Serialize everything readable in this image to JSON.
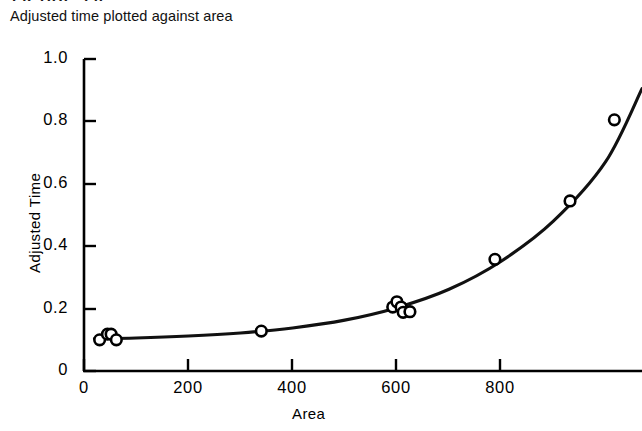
{
  "figure": {
    "top_remnant": "FIGURE 2.9",
    "caption": "Adjusted time plotted against area"
  },
  "chart_data": {
    "type": "scatter",
    "title": "Adjusted time plotted against area",
    "xlabel": "Area",
    "ylabel": "Adjusted Time",
    "xlim": [
      0,
      1070
    ],
    "ylim": [
      0,
      1.0
    ],
    "grid": false,
    "legend": null,
    "x_ticks": [
      0,
      200,
      400,
      600,
      800
    ],
    "x_tick_labels": [
      "0",
      "200",
      "400",
      "600",
      "800"
    ],
    "y_ticks": [
      0,
      0.2,
      0.4,
      0.6,
      0.8,
      1.0
    ],
    "y_tick_labels": [
      "0",
      "0.2",
      "0.4",
      "0.6",
      "0.8",
      "1.0"
    ],
    "marker": "open-circle",
    "points": [
      {
        "x": 30,
        "y": 0.1
      },
      {
        "x": 45,
        "y": 0.118
      },
      {
        "x": 52,
        "y": 0.118
      },
      {
        "x": 62,
        "y": 0.1
      },
      {
        "x": 340,
        "y": 0.128
      },
      {
        "x": 592,
        "y": 0.205
      },
      {
        "x": 600,
        "y": 0.222
      },
      {
        "x": 608,
        "y": 0.205
      },
      {
        "x": 612,
        "y": 0.188
      },
      {
        "x": 625,
        "y": 0.19
      },
      {
        "x": 788,
        "y": 0.358
      },
      {
        "x": 932,
        "y": 0.545
      },
      {
        "x": 1017,
        "y": 0.805
      }
    ],
    "series": [
      {
        "name": "fitted curve",
        "type": "line",
        "x": [
          20,
          100,
          200,
          300,
          400,
          500,
          600,
          700,
          800,
          900,
          1000,
          1070
        ],
        "y": [
          0.104,
          0.106,
          0.112,
          0.122,
          0.138,
          0.163,
          0.203,
          0.262,
          0.352,
          0.48,
          0.67,
          0.905
        ]
      }
    ]
  },
  "axes_labels": {
    "x_title": "Area",
    "y_title": "Adjusted Time"
  }
}
